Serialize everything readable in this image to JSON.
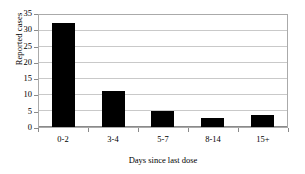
{
  "chart_data": {
    "type": "bar",
    "title": "",
    "xlabel": "Days since last dose",
    "ylabel": "Reported cases",
    "categories": [
      "0-2",
      "3-4",
      "5-7",
      "8-14",
      "15+"
    ],
    "values": [
      32,
      11,
      4.8,
      2.8,
      3.8
    ],
    "ylim": [
      0,
      35
    ],
    "yticks": [
      0,
      5,
      10,
      15,
      20,
      25,
      30,
      35
    ],
    "ytick_labels": [
      "0",
      "5",
      "10",
      "15",
      "20",
      "25",
      "30",
      "35"
    ],
    "grid": "horizontal",
    "legend": "none",
    "bar_color": "#000000",
    "gridline_color": "#c9c9c9",
    "axis_color": "#8a8a8a",
    "background_color": "#ffffff"
  }
}
